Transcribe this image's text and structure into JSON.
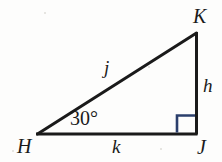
{
  "figure": {
    "kind": "right-triangle-diagram",
    "background_color": "#fdfdfc",
    "stroke_color": "#1a1a1a",
    "right_angle_color": "#2b3f6c",
    "vertices": {
      "H": {
        "label": "H",
        "x": 37,
        "y": 134
      },
      "J": {
        "label": "J",
        "x": 196,
        "y": 134
      },
      "K": {
        "label": "K",
        "x": 196,
        "y": 33
      }
    },
    "sides": {
      "hypotenuse": {
        "label": "j",
        "from": "H",
        "to": "K"
      },
      "vertical": {
        "label": "h",
        "from": "K",
        "to": "J"
      },
      "base": {
        "label": "k",
        "from": "H",
        "to": "J"
      }
    },
    "angles": {
      "at_H": {
        "label": "30°",
        "value": 30,
        "unit": "degrees"
      },
      "at_J": {
        "label": "",
        "value": 90,
        "unit": "degrees",
        "marker": "right-angle-square"
      }
    }
  },
  "labels": {
    "vertex_H": "H",
    "vertex_J": "J",
    "vertex_K": "K",
    "side_j": "j",
    "side_h": "h",
    "side_k": "k",
    "angle_H": "30°"
  }
}
